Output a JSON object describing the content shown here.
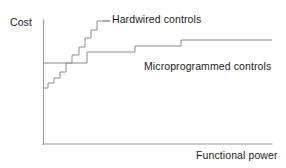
{
  "figure": {
    "width": 286,
    "height": 168,
    "background": "#ffffff",
    "line_color": "#8c8c8c",
    "axis_color": "#9a9a9a",
    "text_color": "#1c1c1c"
  },
  "axes": {
    "y_label": "Cost",
    "x_label": "Functional power",
    "y_axis": {
      "x": 43,
      "y_top": 20,
      "y_bottom": 144
    },
    "x_axis": {
      "y": 144,
      "x_left": 43,
      "x_right": 272
    }
  },
  "series_labels": {
    "hardwired": "Hardwired controls",
    "microprogrammed": "Microprogrammed controls"
  },
  "chart_data": {
    "type": "line",
    "title": "",
    "subtitle": "",
    "xlabel": "Functional power",
    "ylabel": "Cost",
    "xlim": [
      43,
      272
    ],
    "ylim": [
      144,
      20
    ],
    "grid": false,
    "axis_ticks": false,
    "tick_labels": {
      "x": [],
      "y": []
    },
    "legend": "inline-annotations",
    "series": [
      {
        "name": "Hardwired controls",
        "style": "staircase",
        "shape": "steeply increasing step function",
        "label_position": {
          "x": 112,
          "y": 13
        },
        "leader_line": {
          "x1": 103,
          "y1": 21,
          "x2": 110,
          "y2": 21
        },
        "points": [
          [
            43,
            88
          ],
          [
            48,
            88
          ],
          [
            48,
            83
          ],
          [
            54,
            83
          ],
          [
            54,
            78
          ],
          [
            60,
            78
          ],
          [
            60,
            72
          ],
          [
            66,
            72
          ],
          [
            66,
            63
          ],
          [
            72,
            63
          ],
          [
            72,
            55
          ],
          [
            79,
            55
          ],
          [
            79,
            47
          ],
          [
            85,
            47
          ],
          [
            85,
            38
          ],
          [
            91,
            38
          ],
          [
            91,
            30
          ],
          [
            97,
            30
          ],
          [
            97,
            21
          ],
          [
            110,
            21
          ]
        ]
      },
      {
        "name": "Microprogrammed controls",
        "style": "staircase",
        "shape": "high fixed base cost, shallow step increases",
        "label_position": {
          "x": 144,
          "y": 60
        },
        "points": [
          [
            43,
            63
          ],
          [
            87,
            63
          ],
          [
            87,
            52
          ],
          [
            135,
            52
          ],
          [
            135,
            46
          ],
          [
            181,
            46
          ],
          [
            181,
            40
          ],
          [
            272,
            40
          ]
        ]
      }
    ],
    "annotations": [
      {
        "text": "Hardwired controls",
        "x": 112,
        "y": 13
      },
      {
        "text": "Microprogrammed controls",
        "x": 144,
        "y": 60
      },
      {
        "text": "Cost",
        "x": 10,
        "y": 16
      },
      {
        "text": "Functional power",
        "x": 196,
        "y": 149
      }
    ]
  }
}
